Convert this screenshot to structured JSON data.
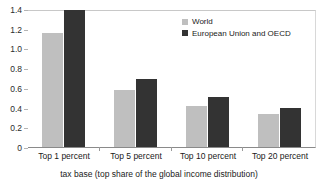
{
  "chart_data": {
    "type": "bar",
    "title": "",
    "xlabel": "tax base (top share of the global income distribution)",
    "ylabel": "",
    "categories": [
      "Top 1 percent",
      "Top 5 percent",
      "Top 10 percent",
      "Top 20 percent"
    ],
    "series": [
      {
        "name": "World",
        "color": "#bfbfbf",
        "values": [
          1.16,
          0.58,
          0.42,
          0.33
        ]
      },
      {
        "name": "European Union and OECD",
        "color": "#333333",
        "values": [
          1.39,
          0.69,
          0.51,
          0.4
        ]
      }
    ],
    "ylim": [
      0,
      1.4
    ],
    "ytick_values": [
      0,
      0.2,
      0.4,
      0.6,
      0.8,
      1.0,
      1.2,
      1.4
    ],
    "ytick_labels": [
      "0",
      "0.2",
      "0.4",
      "0.6",
      "0.8",
      "1.0",
      "1.2",
      "1.4"
    ],
    "grid": false,
    "legend_position": "top-right"
  },
  "legend": {
    "entries": [
      {
        "label": "World",
        "swatch": "world-legend-swatch"
      },
      {
        "label": "European Union and OECD",
        "swatch": "eu-oecd-legend-swatch"
      }
    ]
  }
}
